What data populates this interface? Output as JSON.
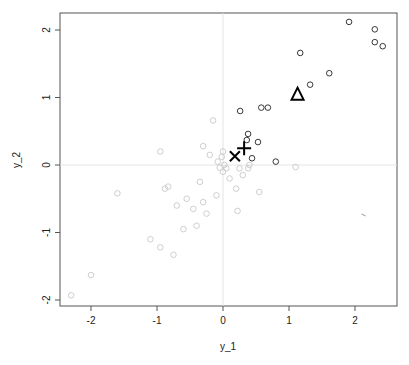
{
  "chart_data": {
    "type": "scatter",
    "title": "",
    "xlabel": "y_1",
    "ylabel": "y_2",
    "xlim": [
      -2.4,
      2.65
    ],
    "ylim": [
      -2.07,
      2.25
    ],
    "xticks": [
      -2,
      -1,
      0,
      1,
      2
    ],
    "yticks": [
      -2,
      -1,
      0,
      1,
      2
    ],
    "grid": false,
    "reference_lines": {
      "x": 0,
      "y": 0
    },
    "legend": null,
    "series": [
      {
        "name": "highlighted points",
        "marker": "circle-open",
        "color": "#222222",
        "points": [
          [
            1.91,
            2.12
          ],
          [
            2.3,
            2.01
          ],
          [
            2.3,
            1.82
          ],
          [
            2.42,
            1.76
          ],
          [
            1.17,
            1.66
          ],
          [
            1.61,
            1.36
          ],
          [
            1.32,
            1.19
          ],
          [
            0.58,
            0.85
          ],
          [
            0.68,
            0.85
          ],
          [
            0.26,
            0.8
          ],
          [
            0.38,
            0.46
          ],
          [
            0.36,
            0.37
          ],
          [
            0.53,
            0.34
          ],
          [
            0.44,
            0.1
          ],
          [
            0.8,
            0.05
          ]
        ]
      },
      {
        "name": "background points",
        "marker": "circle-open",
        "color": "#c8c8c8",
        "points": [
          [
            -2.3,
            -1.93
          ],
          [
            -2.0,
            -1.63
          ],
          [
            -1.6,
            -0.42
          ],
          [
            -1.1,
            -1.1
          ],
          [
            -0.95,
            0.2
          ],
          [
            -0.95,
            -1.22
          ],
          [
            -0.88,
            -0.35
          ],
          [
            -0.83,
            -0.32
          ],
          [
            -0.75,
            -1.33
          ],
          [
            -0.7,
            -0.6
          ],
          [
            -0.6,
            -0.95
          ],
          [
            -0.55,
            -0.5
          ],
          [
            -0.45,
            -0.65
          ],
          [
            -0.4,
            -0.9
          ],
          [
            -0.35,
            -0.25
          ],
          [
            -0.3,
            -0.55
          ],
          [
            -0.3,
            0.28
          ],
          [
            -0.25,
            -0.72
          ],
          [
            -0.2,
            0.15
          ],
          [
            -0.15,
            0.66
          ],
          [
            -0.1,
            -0.45
          ],
          [
            -0.08,
            0.05
          ],
          [
            -0.05,
            -0.04
          ],
          [
            -0.02,
            0.12
          ],
          [
            0.0,
            0.2
          ],
          [
            0.0,
            -0.1
          ],
          [
            0.02,
            0.0
          ],
          [
            0.05,
            -0.05
          ],
          [
            0.1,
            -0.2
          ],
          [
            0.2,
            -0.35
          ],
          [
            0.25,
            -0.05
          ],
          [
            0.3,
            -0.15
          ],
          [
            0.38,
            -0.05
          ],
          [
            0.55,
            -0.4
          ],
          [
            0.22,
            -0.68
          ],
          [
            1.1,
            -0.03
          ],
          [
            0.4,
            0.0
          ]
        ]
      },
      {
        "name": "triangle marker",
        "marker": "triangle-open",
        "color": "#000000",
        "points": [
          [
            1.13,
            1.05
          ]
        ]
      },
      {
        "name": "plus marker",
        "marker": "plus",
        "color": "#000000",
        "points": [
          [
            0.32,
            0.25
          ]
        ]
      },
      {
        "name": "x marker",
        "marker": "x",
        "color": "#000000",
        "points": [
          [
            0.18,
            0.13
          ]
        ]
      }
    ],
    "annotations": [
      {
        "type": "small-tick-mark",
        "x": 2.13,
        "y": -0.74,
        "color": "#999999"
      }
    ]
  }
}
